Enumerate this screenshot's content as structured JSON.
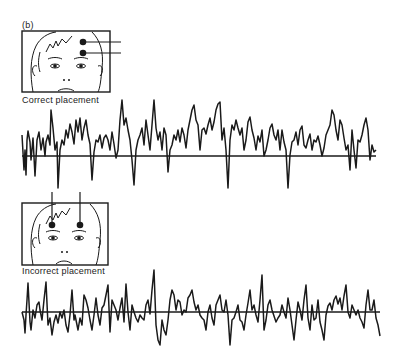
{
  "figure": {
    "panel_label": "(b)",
    "panels": [
      {
        "caption": "Correct placement",
        "electrodes": "two electrodes stacked vertically over one eyebrow/forehead, leads exiting to the right",
        "trace_description": "EEG-like signal, mostly above baseline with large downward spikes"
      },
      {
        "caption": "Incorrect placement",
        "electrodes": "two electrodes side by side over forehead, leads exiting upward",
        "trace_description": "noisier, lower-amplitude signal centered on baseline"
      }
    ]
  },
  "colors": {
    "ink": "#1a1a1a",
    "background": "#ffffff"
  }
}
